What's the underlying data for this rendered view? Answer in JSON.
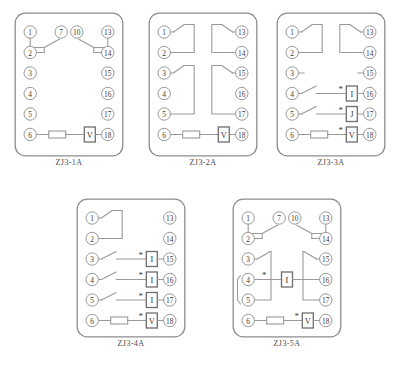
{
  "page": {
    "background_color": "#ffffff",
    "line_color": "#9a9a9a",
    "box_stroke_color": "#6e6e6e",
    "text_color": "#3a3a3a",
    "panel_stroke_color": "#8d8d8d"
  },
  "symbols": {
    "coil_current": "I",
    "coil_j": "J",
    "coil_voltage": "V",
    "polarity_mark": "*"
  },
  "diagrams": [
    {
      "id": "zj3-1a",
      "caption": "ZJ3-1A",
      "x": 14,
      "y": 12,
      "width": 110,
      "height": 145,
      "left_terminals": [
        "1",
        "2",
        "3",
        "4",
        "5",
        "6"
      ],
      "right_terminals": [
        "13",
        "14",
        "15",
        "16",
        "17",
        "18"
      ],
      "inner_terminals": [
        "7",
        "10"
      ],
      "changeover_pairs": [
        {
          "common": "2",
          "normally_closed": "1",
          "moving_to": "7"
        },
        {
          "common": "14",
          "normally_closed": "13",
          "moving_to": "10"
        }
      ],
      "coil_row": {
        "from": "6",
        "to": "18",
        "resistor": true,
        "coil": "V",
        "polarity": false
      },
      "contacts": [],
      "unused_terminals": [
        "3",
        "4",
        "5",
        "15",
        "16",
        "17"
      ]
    },
    {
      "id": "zj3-2a",
      "caption": "ZJ3-2A",
      "x": 148,
      "y": 12,
      "width": 110,
      "height": 145,
      "left_terminals": [
        "1",
        "2",
        "3",
        "4",
        "5",
        "6"
      ],
      "right_terminals": [
        "13",
        "14",
        "15",
        "16",
        "17",
        "18"
      ],
      "inner_terminals": [],
      "changeover_pairs": [],
      "switch_loops": [
        {
          "from": "1",
          "to": "2",
          "side": "left"
        },
        {
          "from": "13",
          "to": "14",
          "side": "right"
        },
        {
          "from": "3",
          "to": "5",
          "side": "left"
        },
        {
          "from": "15",
          "to": "17",
          "side": "right"
        }
      ],
      "coil_row": {
        "from": "6",
        "to": "18",
        "resistor": true,
        "coil": "V",
        "polarity": false
      },
      "unused_terminals": [
        "4",
        "16"
      ]
    },
    {
      "id": "zj3-3a",
      "caption": "ZJ3-3A",
      "x": 276,
      "y": 12,
      "width": 110,
      "height": 145,
      "left_terminals": [
        "1",
        "2",
        "3",
        "4",
        "5",
        "6"
      ],
      "right_terminals": [
        "13",
        "14",
        "15",
        "16",
        "17",
        "18"
      ],
      "inner_terminals": [],
      "switch_loops": [
        {
          "from": "1",
          "to": "2",
          "side": "left"
        },
        {
          "from": "13",
          "to": "14",
          "side": "right"
        }
      ],
      "stub_terminals": [
        "3",
        "15"
      ],
      "contact_coil_rows": [
        {
          "from": "4",
          "to": "16",
          "coil": "I",
          "polarity": true,
          "switch": true
        },
        {
          "from": "5",
          "to": "17",
          "coil": "J",
          "polarity": true,
          "switch": true
        }
      ],
      "coil_row": {
        "from": "6",
        "to": "18",
        "resistor": true,
        "coil": "V",
        "polarity": true
      },
      "unused_terminals": []
    },
    {
      "id": "zj3-4a",
      "caption": "ZJ3-4A",
      "x": 76,
      "y": 198,
      "width": 110,
      "height": 140,
      "left_terminals": [
        "1",
        "2",
        "3",
        "4",
        "5",
        "6"
      ],
      "right_terminals": [
        "13",
        "14",
        "15",
        "16",
        "17",
        "18"
      ],
      "inner_terminals": [],
      "switch_loops": [
        {
          "from": "1",
          "to": "2",
          "side": "left"
        }
      ],
      "stub_terminals": [],
      "contact_coil_rows": [
        {
          "from": "3",
          "to": "15",
          "coil": "I",
          "polarity": true,
          "switch": true
        },
        {
          "from": "4",
          "to": "16",
          "coil": "I",
          "polarity": true,
          "switch": true
        },
        {
          "from": "5",
          "to": "17",
          "coil": "I",
          "polarity": true,
          "switch": true
        }
      ],
      "coil_row": {
        "from": "6",
        "to": "18",
        "resistor": true,
        "coil": "V",
        "polarity": true
      },
      "unused_terminals": [
        "13",
        "14"
      ]
    },
    {
      "id": "zj3-5a",
      "caption": "ZJ3-5A",
      "x": 232,
      "y": 198,
      "width": 110,
      "height": 140,
      "left_terminals": [
        "1",
        "2",
        "3",
        "4",
        "5",
        "6"
      ],
      "right_terminals": [
        "13",
        "14",
        "15",
        "16",
        "17",
        "18"
      ],
      "inner_terminals": [
        "7",
        "10"
      ],
      "changeover_pairs": [
        {
          "common": "2",
          "normally_closed": "1",
          "moving_to": "7"
        },
        {
          "common": "14",
          "normally_closed": "13",
          "moving_to": "10"
        }
      ],
      "center_coil": {
        "coil": "I",
        "polarity_terminal": "4",
        "bridged_terminals": [
          "4",
          "5"
        ],
        "switch_terminals": [
          "3",
          "15"
        ],
        "output_terminals": [
          "16",
          "17"
        ]
      },
      "coil_row": {
        "from": "6",
        "to": "18",
        "resistor": true,
        "coil": "V",
        "polarity": true
      },
      "unused_terminals": []
    }
  ]
}
